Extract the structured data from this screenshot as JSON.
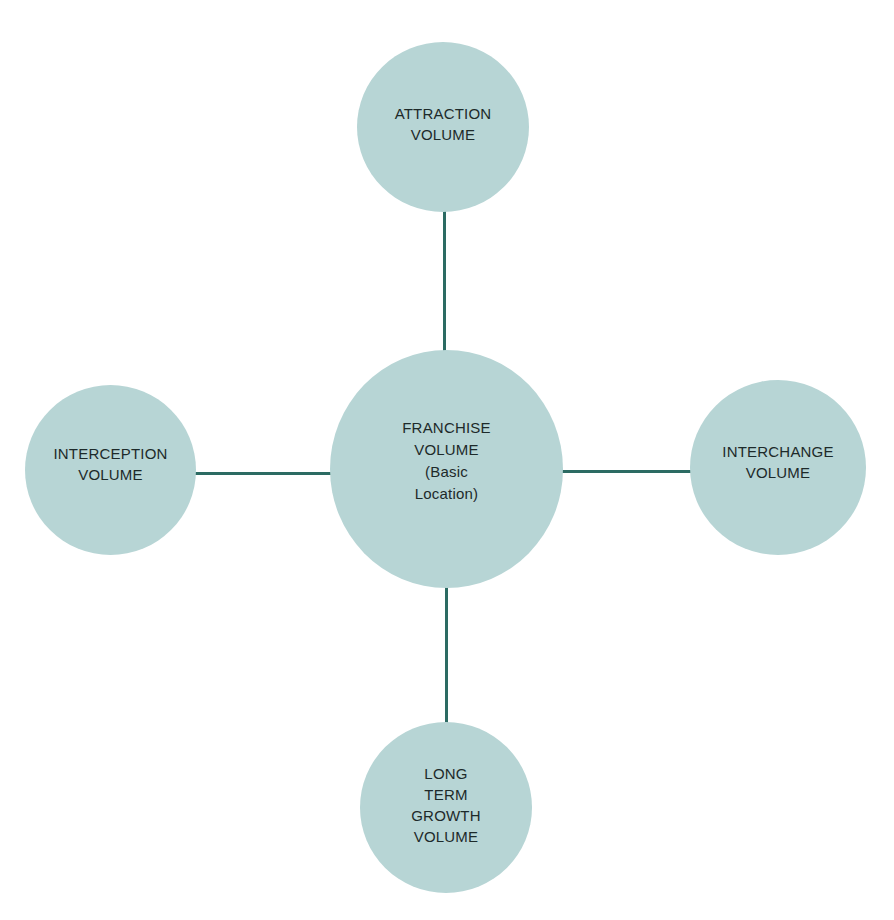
{
  "diagram": {
    "colors": {
      "circle_fill": "#b7d5d5",
      "connector": "#2c6b63",
      "text": "#1d2a2a",
      "background": "#ffffff"
    },
    "center": {
      "label": "FRANCHISE\nVOLUME\n(Basic\nLocation)"
    },
    "nodes": {
      "top": {
        "label": "ATTRACTION\nVOLUME"
      },
      "left": {
        "label": "INTERCEPTION\nVOLUME"
      },
      "right": {
        "label": "INTERCHANGE\nVOLUME"
      },
      "bottom": {
        "label": "LONG\nTERM\nGROWTH\nVOLUME"
      }
    }
  }
}
